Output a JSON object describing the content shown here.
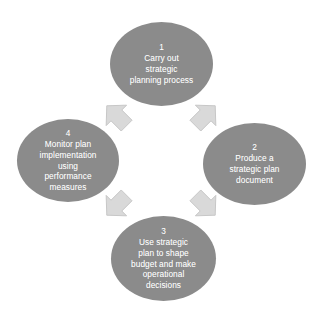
{
  "diagram": {
    "background_color": "#ffffff",
    "node_fill_color": "#8b8b8b",
    "node_text_color": "#ffffff",
    "arrow_fill_color": "#d9d9d9",
    "arrow_stroke_color": "#c2c2c2",
    "nodes": [
      {
        "number": "1",
        "text": "1\nCarry out\nstrategic\nplanning process",
        "position": "top"
      },
      {
        "number": "2",
        "text": "2\nProduce a\nstrategic plan\ndocument",
        "position": "right"
      },
      {
        "number": "3",
        "text": "3\nUse strategic\nplan to shape\nbudget and make\noperational\ndecisions",
        "position": "bottom"
      },
      {
        "number": "4",
        "text": "4\nMonitor plan\nimplementation\nusing\nperformance\nmeasures",
        "position": "left"
      }
    ],
    "arrows": [
      {
        "from": "4",
        "to": "1",
        "direction": "up-right"
      },
      {
        "from": "1",
        "to": "2",
        "direction": "down-right"
      },
      {
        "from": "2",
        "to": "3",
        "direction": "down-left"
      },
      {
        "from": "3",
        "to": "4",
        "direction": "up-left"
      }
    ]
  }
}
